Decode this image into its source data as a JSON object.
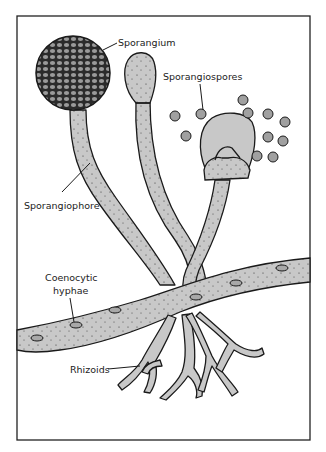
{
  "diagram": {
    "colors": {
      "frame": "#222222",
      "fill": "#c8c8c8",
      "outline": "#1a1a1a",
      "sporangium_dark": "#2b2b2b",
      "sporangium_cell": "#9a9a9a",
      "background": "#ffffff"
    },
    "labels": {
      "sporangium": "Sporangium",
      "sporangiospores": "Sporangiospores",
      "sporangiophore": "Sporangiophore",
      "coenocytic_line1": "Coenocytic",
      "coenocytic_line2": "hyphae",
      "rhizoids": "Rhizoids"
    }
  }
}
